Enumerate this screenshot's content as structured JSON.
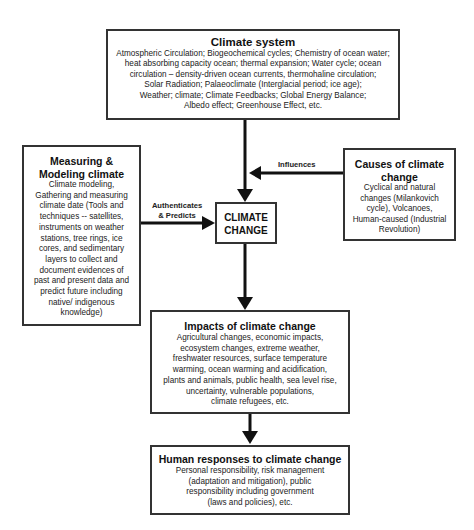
{
  "climate_system": {
    "title": "Climate system",
    "lines": [
      "Atmospheric Circulation; Biogeochemical cycles; Chemistry of ocean water;",
      "heat absorbing capacity ocean; thermal expansion; Water cycle; ocean",
      "circulation – density-driven ocean currents, thermohaline circulation;",
      "Solar Radiation; Palaeoclimate (Interglacial period; ice age);",
      "Weather; climate; Climate Feedbacks; Global Energy Balance;",
      "Albedo effect; Greenhouse Effect, etc."
    ]
  },
  "measuring": {
    "title_line1": "Measuring &",
    "title_line2": "Modeling climate",
    "lines": [
      "Climate modeling,",
      "Gathering and measuring",
      "climate date (Tools and",
      "techniques -- satellites,",
      "instruments on weather",
      "stations, tree rings, ice",
      "cores, and sedimentary",
      "layers to collect and",
      "document evidences of",
      "past and present data and",
      "predict future including",
      "native/ indigenous",
      "knowledge)"
    ]
  },
  "causes": {
    "title_line1": "Causes of climate",
    "title_line2": "change",
    "lines": [
      "Cyclical and natural",
      "changes (Milankovich",
      "cycle), Volcanoes,",
      "Human-caused (Industrial",
      "Revolution)"
    ]
  },
  "climate_change": {
    "line1": "CLIMATE",
    "line2": "CHANGE"
  },
  "labels": {
    "influences": "Influences",
    "authenticates_line1": "Authenticates",
    "authenticates_line2": "& Predicts"
  },
  "impacts": {
    "title": "Impacts of climate change",
    "lines": [
      "Agricultural changes, economic impacts,",
      "ecosystem changes, extreme weather,",
      "freshwater resources, surface temperature",
      "warming, ocean warming and acidification,",
      "plants and animals, public health, sea level rise,",
      "uncertainty, vulnerable populations,",
      "climate refugees, etc."
    ]
  },
  "responses": {
    "title": "Human responses to climate change",
    "lines": [
      "Personal responsibility, risk management",
      "(adaptation and mitigation), public",
      "responsibility including government",
      "(laws and policies), etc."
    ]
  },
  "colors": {
    "border": "#333333",
    "arrow": "#111111",
    "text": "#222222"
  }
}
